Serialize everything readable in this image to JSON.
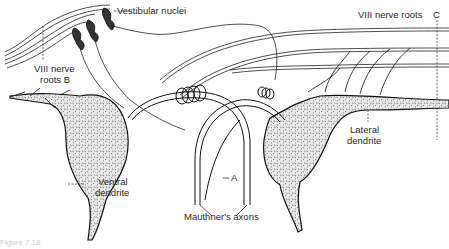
{
  "figure": {
    "type": "anatomical-illustration",
    "labels": {
      "vestibular_nuclei": "Vestibular nuclei",
      "viii_roots_b_line1": "VIII nerve",
      "viii_roots_b_line2": "roots B",
      "viii_roots_c": "VIII nerve roots",
      "c_marker": "C",
      "lateral_dendrite_line1": "Lateral",
      "lateral_dendrite_line2": "dendrite",
      "ventral_dendrite_line1": "Ventral",
      "ventral_dendrite_line2": "dendrite",
      "a_marker": "A",
      "mauthner_axons": "Mauthner's axons"
    },
    "caption_partial": "Figure 7.18"
  },
  "colors": {
    "ink": "#1e1e1e",
    "background": "#ffffff",
    "label": "#2a2a2a"
  }
}
